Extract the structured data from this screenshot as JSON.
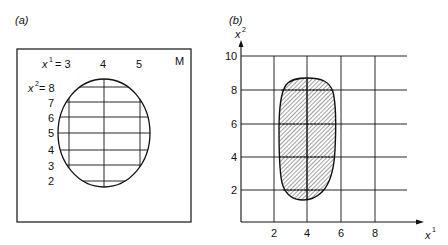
{
  "panel_a": {
    "label": "(a)",
    "manifold_label": "M",
    "x1_prefix": "x",
    "x1_sup": "1",
    "x1_eq": "= 3",
    "x1_values": [
      "4",
      "5"
    ],
    "x2_prefix": "x",
    "x2_sup": "2",
    "x2_eq": "= 8",
    "x2_values": [
      "7",
      "6",
      "5",
      "4",
      "3",
      "2"
    ]
  },
  "panel_b": {
    "label": "(b)",
    "y_axis_label": "x",
    "y_axis_sup": "2",
    "x_axis_label": "x",
    "x_axis_sup": "1",
    "y_ticks": [
      "10",
      "8",
      "6",
      "4",
      "2"
    ],
    "x_ticks": [
      "2",
      "4",
      "6",
      "8"
    ]
  },
  "colors": {
    "line": "#111111",
    "background": "#ffffff"
  }
}
